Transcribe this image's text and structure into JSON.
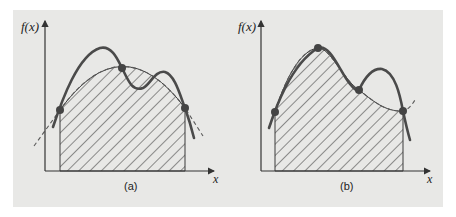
{
  "figure": {
    "panels": [
      {
        "id": "a",
        "caption": "(a)",
        "y_axis_label": "f(x)",
        "x_axis_label": "x",
        "description": "Function f(x) (solid) approximated by a second-order polynomial (dashed) through three points; hatched area under the polynomial",
        "points": [
          [
            60,
            110
          ],
          [
            122,
            68
          ],
          [
            185,
            108
          ]
        ]
      },
      {
        "id": "b",
        "caption": "(b)",
        "y_axis_label": "f(x)",
        "x_axis_label": "x",
        "description": "Function f(x) (solid) approximated by a third-order polynomial (dashed) through four points; hatched area under the polynomial",
        "points": [
          [
            275,
            112
          ],
          [
            318,
            48
          ],
          [
            359,
            90
          ],
          [
            403,
            111
          ]
        ]
      }
    ],
    "colors": {
      "background": "#e8e8e6",
      "curve": "#4a4a4a",
      "dashed": "#5a5a5a",
      "hatch": "#3a3a3a",
      "axis": "#333333",
      "point": "#444444"
    }
  }
}
